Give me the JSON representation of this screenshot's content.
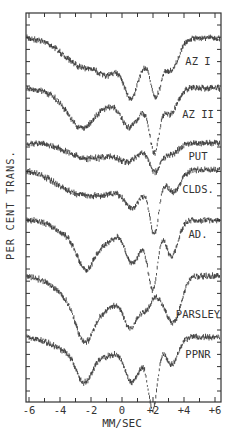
{
  "chart_data": {
    "type": "line",
    "title": "",
    "xlabel": "MM/SEC",
    "ylabel": "PER CENT TRANS.",
    "xlim": [
      -6.4,
      6.6
    ],
    "x_ticks": [
      -6,
      -4,
      -2,
      0,
      2,
      4,
      6
    ],
    "x_tick_labels": [
      "-6",
      "-4",
      "-2",
      "0",
      "+2",
      "+4",
      "+6"
    ],
    "grid": false,
    "legend_position": "inline-right",
    "series": [
      {
        "name": "AZ I",
        "baseline_y": 38,
        "label_y": 65,
        "dips": [
          [
            -2.6,
            28,
            1.2
          ],
          [
            -1.0,
            14,
            0.6
          ],
          [
            0.6,
            44,
            0.45
          ],
          [
            2.2,
            50,
            0.35
          ],
          [
            3.2,
            32,
            0.45
          ],
          [
            -0.2,
            18,
            0.9
          ],
          [
            1.5,
            14,
            0.5
          ]
        ]
      },
      {
        "name": "AZ II",
        "baseline_y": 88,
        "label_y": 118,
        "dips": [
          [
            -2.5,
            34,
            0.8
          ],
          [
            -3.6,
            10,
            1.0
          ],
          [
            0.4,
            30,
            0.5
          ],
          [
            -0.8,
            14,
            0.7
          ],
          [
            2.1,
            56,
            0.3
          ],
          [
            3.1,
            26,
            0.45
          ],
          [
            1.3,
            18,
            0.6
          ]
        ]
      },
      {
        "name": "PUT",
        "baseline_y": 143,
        "label_y": 160,
        "dips": [
          [
            -2.5,
            12,
            1.2
          ],
          [
            0.5,
            14,
            0.7
          ],
          [
            2.1,
            26,
            0.35
          ],
          [
            3.1,
            12,
            0.5
          ],
          [
            -0.9,
            7,
            1.2
          ]
        ]
      },
      {
        "name": "CLDS.",
        "baseline_y": 170,
        "label_y": 193,
        "dips": [
          [
            -2.3,
            22,
            1.2
          ],
          [
            -4.0,
            8,
            1.0
          ],
          [
            0.6,
            28,
            0.5
          ],
          [
            -0.6,
            14,
            0.8
          ],
          [
            2.1,
            58,
            0.3
          ],
          [
            3.3,
            22,
            0.45
          ],
          [
            1.4,
            14,
            0.5
          ]
        ]
      },
      {
        "name": "AD.",
        "baseline_y": 220,
        "label_y": 238,
        "dips": [
          [
            -2.3,
            44,
            0.6
          ],
          [
            -3.6,
            12,
            0.9
          ],
          [
            -0.9,
            20,
            0.6
          ],
          [
            0.6,
            38,
            0.45
          ],
          [
            2.0,
            62,
            0.3
          ],
          [
            3.2,
            36,
            0.4
          ],
          [
            1.4,
            16,
            0.5
          ]
        ]
      },
      {
        "name": "PARSLEY",
        "baseline_y": 276,
        "label_y": 318,
        "dips": [
          [
            -2.4,
            50,
            0.6
          ],
          [
            -3.5,
            18,
            1.0
          ],
          [
            -1.0,
            30,
            0.8
          ],
          [
            0.6,
            48,
            0.5
          ],
          [
            1.6,
            26,
            0.35
          ],
          [
            3.4,
            42,
            0.45
          ],
          [
            2.6,
            20,
            0.45
          ]
        ]
      },
      {
        "name": "PPNR",
        "baseline_y": 337,
        "label_y": 358,
        "dips": [
          [
            -2.4,
            38,
            0.55
          ],
          [
            -3.6,
            12,
            1.0
          ],
          [
            -0.9,
            18,
            0.7
          ],
          [
            0.6,
            40,
            0.45
          ],
          [
            2.0,
            66,
            0.3
          ],
          [
            3.2,
            28,
            0.4
          ],
          [
            1.4,
            14,
            0.5
          ]
        ]
      }
    ],
    "label_x": 198
  },
  "frame": {
    "left": 26,
    "right": 221,
    "top": 13,
    "bottom": 402,
    "x_origin_px": 122,
    "px_per_unit": 15.5
  },
  "colors": {
    "ink": "#222222",
    "frame": "#333333",
    "background": "#ffffff"
  }
}
